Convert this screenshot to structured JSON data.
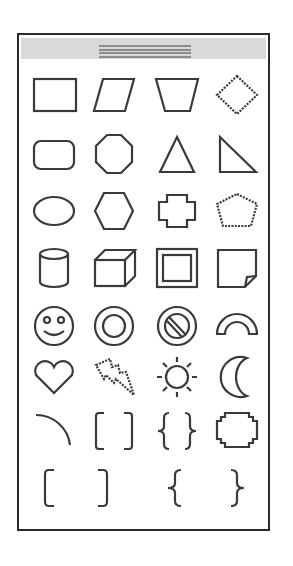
{
  "palette": {
    "title": "",
    "titlebar_color": "#d9d9d9",
    "border_color": "#2a2a2a",
    "stroke_color": "#3a3a3a",
    "columns": 4,
    "rows": 8,
    "shapes": [
      {
        "name": "rectangle",
        "icon": "rectangle-icon"
      },
      {
        "name": "parallelogram",
        "icon": "parallelogram-icon"
      },
      {
        "name": "trapezoid",
        "icon": "trapezoid-icon"
      },
      {
        "name": "diamond",
        "icon": "diamond-icon"
      },
      {
        "name": "rounded-rectangle",
        "icon": "rounded-rectangle-icon"
      },
      {
        "name": "octagon",
        "icon": "octagon-icon"
      },
      {
        "name": "isosceles-triangle",
        "icon": "triangle-icon"
      },
      {
        "name": "right-triangle",
        "icon": "right-triangle-icon"
      },
      {
        "name": "ellipse",
        "icon": "ellipse-icon"
      },
      {
        "name": "hexagon",
        "icon": "hexagon-icon"
      },
      {
        "name": "cross",
        "icon": "cross-icon"
      },
      {
        "name": "pentagon",
        "icon": "pentagon-icon"
      },
      {
        "name": "can",
        "icon": "cylinder-icon"
      },
      {
        "name": "cube",
        "icon": "cube-icon"
      },
      {
        "name": "bevel",
        "icon": "bevel-icon"
      },
      {
        "name": "folded-corner",
        "icon": "folded-corner-icon"
      },
      {
        "name": "smiley-face",
        "icon": "smiley-icon"
      },
      {
        "name": "donut",
        "icon": "donut-icon"
      },
      {
        "name": "no-symbol",
        "icon": "no-symbol-icon"
      },
      {
        "name": "block-arc",
        "icon": "block-arc-icon"
      },
      {
        "name": "heart",
        "icon": "heart-icon"
      },
      {
        "name": "lightning-bolt",
        "icon": "lightning-bolt-icon"
      },
      {
        "name": "sun",
        "icon": "sun-icon"
      },
      {
        "name": "moon",
        "icon": "moon-icon"
      },
      {
        "name": "arc",
        "icon": "arc-icon"
      },
      {
        "name": "double-bracket",
        "icon": "double-bracket-icon"
      },
      {
        "name": "double-brace",
        "icon": "double-brace-icon"
      },
      {
        "name": "plaque",
        "icon": "plaque-icon"
      },
      {
        "name": "left-bracket",
        "icon": "left-bracket-icon"
      },
      {
        "name": "right-bracket",
        "icon": "right-bracket-icon"
      },
      {
        "name": "left-brace",
        "icon": "left-brace-icon"
      },
      {
        "name": "right-brace",
        "icon": "right-brace-icon"
      }
    ]
  }
}
